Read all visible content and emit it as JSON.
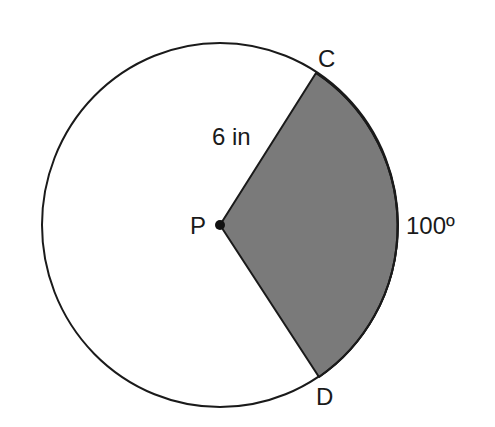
{
  "diagram": {
    "type": "circle-sector",
    "center_label": "P",
    "point_labels": {
      "top": "C",
      "bottom": "D"
    },
    "radius_label": "6 in",
    "angle_label": "100º",
    "colors": {
      "sector_fill": "#7a7a7a",
      "stroke": "#1a1a1a",
      "background": "#ffffff"
    }
  }
}
